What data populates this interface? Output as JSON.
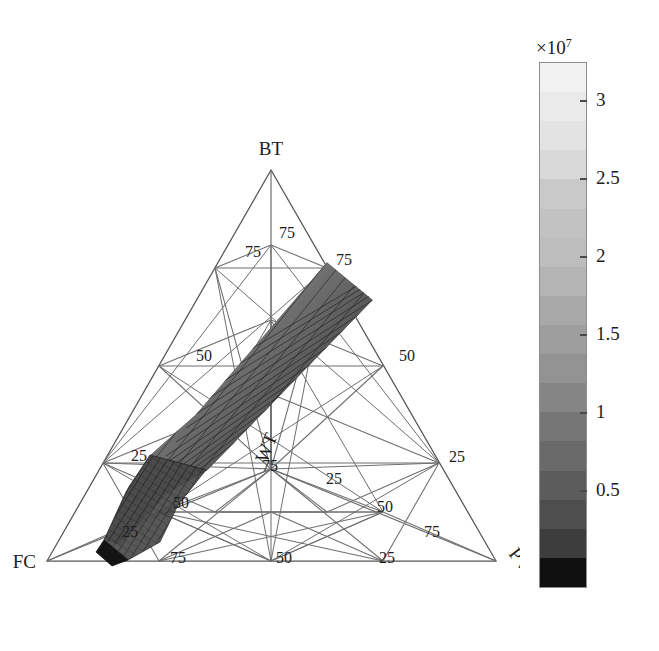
{
  "figure": {
    "type": "quaternary-phase-diagram",
    "background": "#ffffff"
  },
  "diagram": {
    "vertices": [
      {
        "name": "BT",
        "label": "BT",
        "position": "top"
      },
      {
        "name": "FC",
        "label": "FC",
        "position": "bottom-left"
      },
      {
        "name": "PV",
        "label": "PV",
        "position": "bottom-right"
      },
      {
        "name": "WT",
        "label": "WT",
        "position": "interior"
      }
    ],
    "tick_values": [
      25,
      50,
      75
    ],
    "ticks": [
      {
        "label": "75",
        "x": 279,
        "y": 238,
        "edge": "bt-inner-top"
      },
      {
        "label": "75",
        "x": 245,
        "y": 257,
        "edge": "bt-inner-left"
      },
      {
        "label": "75",
        "x": 336,
        "y": 265,
        "edge": "bt-inner-right"
      },
      {
        "label": "50",
        "x": 196,
        "y": 356,
        "edge": "left"
      },
      {
        "label": "50",
        "x": 399,
        "y": 356,
        "edge": "right"
      },
      {
        "label": "25",
        "x": 139,
        "y": 457,
        "edge": "left"
      },
      {
        "label": "25",
        "x": 449,
        "y": 457,
        "edge": "right"
      },
      {
        "label": "25",
        "x": 337,
        "y": 478,
        "edge": "inner"
      },
      {
        "label": "75",
        "x": 268,
        "y": 464,
        "edge": "inner-wt"
      },
      {
        "label": "50",
        "x": 183,
        "y": 503,
        "edge": "inner-lower-left"
      },
      {
        "label": "50",
        "x": 385,
        "y": 509,
        "edge": "inner-lower-right"
      },
      {
        "label": "25",
        "x": 131,
        "y": 531,
        "edge": "left-lower"
      },
      {
        "label": "75",
        "x": 431,
        "y": 531,
        "edge": "right-lower"
      },
      {
        "label": "75",
        "x": 180,
        "y": 552,
        "edge": "bottom"
      },
      {
        "label": "50",
        "x": 286,
        "y": 552,
        "edge": "bottom"
      },
      {
        "label": "25",
        "x": 389,
        "y": 552,
        "edge": "bottom"
      }
    ],
    "surface": {
      "description": "shaded mesh surface band running from upper-right to lower-left",
      "shading": "grayscale, darker toward lower-left"
    }
  },
  "colorbar": {
    "exponent_prefix": "×10",
    "exponent_power": "7",
    "orientation": "vertical",
    "ticks": [
      {
        "label": "3",
        "value": 3.0
      },
      {
        "label": "2.5",
        "value": 2.5
      },
      {
        "label": "2",
        "value": 2.0
      },
      {
        "label": "1.5",
        "value": 1.5
      },
      {
        "label": "1",
        "value": 1.0
      },
      {
        "label": "0.5",
        "value": 0.5
      }
    ],
    "bands": [
      "#f2f2f2",
      "#eaeaea",
      "#e3e3e3",
      "#d9d9d9",
      "#c9c9c9",
      "#c2c2c2",
      "#bdbdbd",
      "#b4b4b4",
      "#a8a8a8",
      "#9e9e9e",
      "#939393",
      "#858585",
      "#767676",
      "#6a6a6a",
      "#5c5c5c",
      "#4e4e4e",
      "#3d3d3d",
      "#101010"
    ]
  },
  "chart_data": {
    "type": "heatmap",
    "title": "",
    "subtitle": "",
    "xlabel": "",
    "ylabel": "",
    "grid": true,
    "legend_position": "right",
    "colorbar_label": "×10⁷",
    "colorbar_ticks": [
      0.5,
      1,
      1.5,
      2,
      2.5,
      3
    ],
    "colorbar_range": [
      0.2,
      3.3
    ],
    "colorscale": "grayscale",
    "axes": [
      "BT",
      "FC",
      "PV",
      "WT"
    ],
    "axis_tick_labels": [
      25,
      50,
      75
    ],
    "annotations": [
      "BT",
      "FC",
      "PV",
      "WT"
    ]
  }
}
